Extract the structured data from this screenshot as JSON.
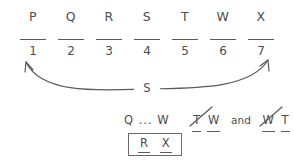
{
  "diagram": {
    "letters": [
      "P",
      "Q",
      "R",
      "S",
      "T",
      "W",
      "X"
    ],
    "slots": [
      {
        "number": "1",
        "value": ""
      },
      {
        "number": "2",
        "value": ""
      },
      {
        "number": "3",
        "value": ""
      },
      {
        "number": "4",
        "value": ""
      },
      {
        "number": "5",
        "value": ""
      },
      {
        "number": "6",
        "value": ""
      },
      {
        "number": "7",
        "value": ""
      }
    ],
    "arc": {
      "label": "S",
      "from_slot": "1",
      "to_slot": "7",
      "icon": "double-headed-curved-arrow-icon"
    },
    "deductions": {
      "chain": "Q ... W",
      "eliminated_pairs": [
        {
          "first": "T",
          "second": "W",
          "icon": "strikethrough-icon"
        },
        {
          "first": "W",
          "second": "T",
          "icon": "strikethrough-icon"
        }
      ],
      "conjunction": "and"
    },
    "boxed_conclusion": {
      "first": "R",
      "second": "X"
    },
    "colors": {
      "ink": "#4d4d4d",
      "rule": "#5a5a5a",
      "box": "#6a6a6a",
      "background": "#ffffff"
    }
  }
}
